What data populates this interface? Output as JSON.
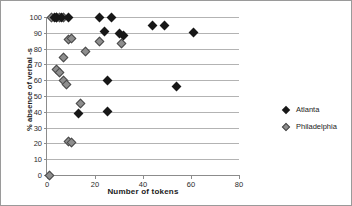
{
  "chart_data": {
    "type": "scatter",
    "title": "",
    "xlabel": "Number of tokens",
    "ylabel": "% absence of verbal -s",
    "xlim": [
      0,
      80
    ],
    "ylim": [
      0,
      100
    ],
    "xticks": [
      0,
      20,
      40,
      60,
      80
    ],
    "yticks": [
      0,
      10,
      20,
      30,
      40,
      50,
      60,
      70,
      80,
      90,
      100
    ],
    "grid": "horizontal",
    "legend_position": "right",
    "colors": {
      "atlanta": "#171717",
      "philadelphia": "#8e8e8e",
      "gridline": "#b3b3b3",
      "axis": "#8c8c8c",
      "border": "#9a9a9a"
    },
    "series": [
      {
        "name": "Atlanta",
        "marker": "diamond",
        "color": "#171717",
        "points": [
          [
            3,
            100
          ],
          [
            4,
            100
          ],
          [
            6,
            100
          ],
          [
            9,
            100
          ],
          [
            22,
            100
          ],
          [
            27,
            100
          ],
          [
            24,
            91
          ],
          [
            30,
            89.5
          ],
          [
            32,
            88
          ],
          [
            44,
            94.5
          ],
          [
            49,
            94.5
          ],
          [
            61,
            90
          ],
          [
            25,
            59.5
          ],
          [
            54,
            56
          ],
          [
            13,
            39
          ],
          [
            25,
            40
          ]
        ]
      },
      {
        "name": "Philadelphia",
        "marker": "diamond",
        "color": "#8e8e8e",
        "points": [
          [
            2,
            100
          ],
          [
            4,
            100
          ],
          [
            5,
            100
          ],
          [
            7,
            100
          ],
          [
            9,
            86
          ],
          [
            10,
            86.5
          ],
          [
            22,
            84.5
          ],
          [
            31,
            83
          ],
          [
            16,
            78
          ],
          [
            7,
            74.5
          ],
          [
            4,
            66.5
          ],
          [
            5,
            65
          ],
          [
            7,
            59.5
          ],
          [
            8,
            57.5
          ],
          [
            14,
            45
          ],
          [
            9,
            21
          ],
          [
            10,
            20.5
          ],
          [
            1,
            0
          ]
        ]
      }
    ]
  },
  "legend": {
    "items": [
      {
        "label": "Atlanta",
        "key": "atlanta"
      },
      {
        "label": "Philadelphia",
        "key": "philadelphia"
      }
    ]
  }
}
